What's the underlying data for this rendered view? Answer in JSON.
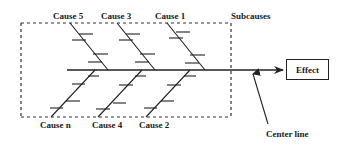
{
  "diagram": {
    "type": "fishbone",
    "effect_label": "Effect",
    "subcauses_label": "Subcauses",
    "center_line_label": "Center line",
    "top_causes": [
      {
        "label": "Cause 5"
      },
      {
        "label": "Cause 3"
      },
      {
        "label": "Cause 1"
      }
    ],
    "bottom_causes": [
      {
        "label": "Cause n"
      },
      {
        "label": "Cause 4"
      },
      {
        "label": "Cause 2"
      }
    ],
    "colors": {
      "line": "#222222",
      "background": "#ffffff"
    }
  }
}
